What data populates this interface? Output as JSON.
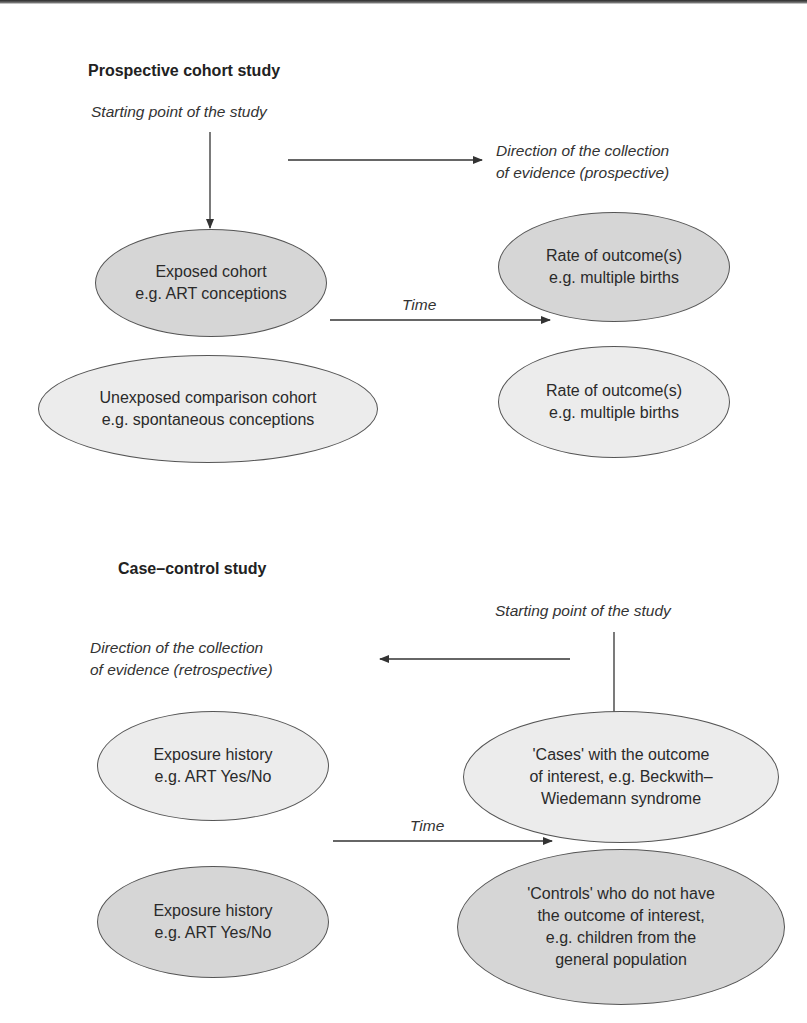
{
  "prospective": {
    "title": "Prospective cohort study",
    "starting_point": "Starting point of the study",
    "direction_line1": "Direction of the collection",
    "direction_line2": "of evidence (prospective)",
    "time_label": "Time",
    "exposed": {
      "line1": "Exposed cohort",
      "line2": "e.g. ART conceptions"
    },
    "unexposed": {
      "line1": "Unexposed comparison cohort",
      "line2": "e.g. spontaneous conceptions"
    },
    "outcome_exposed": {
      "line1": "Rate of outcome(s)",
      "line2": "e.g. multiple births"
    },
    "outcome_unexposed": {
      "line1": "Rate of outcome(s)",
      "line2": "e.g. multiple births"
    }
  },
  "case_control": {
    "title": "Case–control study",
    "starting_point": "Starting point of the study",
    "direction_line1": "Direction of the collection",
    "direction_line2": "of evidence (retrospective)",
    "time_label": "Time",
    "exposure_cases": {
      "line1": "Exposure history",
      "line2": "e.g. ART Yes/No"
    },
    "exposure_controls": {
      "line1": "Exposure history",
      "line2": "e.g. ART Yes/No"
    },
    "cases": {
      "line1": "'Cases' with the outcome",
      "line2": "of interest, e.g. Beckwith–",
      "line3": "Wiedemann syndrome"
    },
    "controls": {
      "line1": "'Controls' who do not have",
      "line2": "the outcome of interest,",
      "line3": "e.g. children from the",
      "line4": "general population"
    }
  },
  "colors": {
    "ellipse_light": "#ececec",
    "ellipse_dark": "#d6d6d6",
    "stroke": "#555555",
    "text": "#2a2a2a"
  }
}
